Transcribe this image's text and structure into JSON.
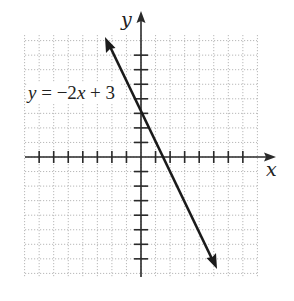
{
  "graph": {
    "equation_label": "y = −2x + 3",
    "equation_parts": {
      "y": "y",
      "eq": " = −2",
      "x": "x",
      "rest": " + 3"
    },
    "x_axis_label": "x",
    "y_axis_label": "y",
    "colors": {
      "axis": "#2a2a2a",
      "line": "#1a1a1a",
      "grid": "#b8b8b8",
      "background": "#ffffff"
    }
  },
  "chart_data": {
    "type": "line",
    "title": "",
    "annotation": "y = -2x + 3",
    "xlabel": "x",
    "ylabel": "y",
    "xlim": [
      -8,
      8
    ],
    "ylim": [
      -8,
      8
    ],
    "grid": true,
    "tick_spacing": 1,
    "tick_labels": "none",
    "series": [
      {
        "name": "y = -2x + 3",
        "slope": -2,
        "intercept": 3,
        "x": [
          -2.5,
          5.5
        ],
        "y": [
          8,
          -8
        ],
        "arrows": "both"
      }
    ]
  }
}
